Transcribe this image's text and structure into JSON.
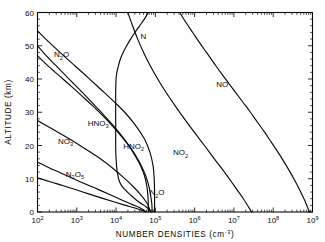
{
  "chart_data": {
    "type": "line",
    "title": "",
    "xlabel": "NUMBER DENSITIES (cm⁻³)",
    "ylabel": "ALTITUDE  (km)",
    "xscale": "log",
    "yscale": "linear",
    "xlim": [
      100,
      1000000000
    ],
    "ylim": [
      0,
      60
    ],
    "grid": false,
    "legend_position": "inline-curve-labels",
    "x_tick_labels": [
      "10²",
      "10³",
      "10⁴",
      "10⁵",
      "10⁶",
      "10⁷",
      "10⁸",
      "10⁹"
    ],
    "x_tick_exponents": [
      2,
      3,
      4,
      5,
      6,
      7,
      8,
      9
    ],
    "y_tick_labels": [
      "0",
      "10",
      "20",
      "30",
      "40",
      "50",
      "60"
    ],
    "y_tick_values": [
      0,
      10,
      20,
      30,
      40,
      50,
      60
    ],
    "axis_color": "#0a0a0a",
    "curve_color": "#0a0a0a",
    "series": [
      {
        "name": "NO",
        "label": "NO",
        "label_x_log": 6.55,
        "label_y_km": 37.5,
        "points_log_alt": [
          [
            5.62,
            60.0
          ],
          [
            5.78,
            57.0
          ],
          [
            5.95,
            54.0
          ],
          [
            6.12,
            51.0
          ],
          [
            6.3,
            48.0
          ],
          [
            6.48,
            45.0
          ],
          [
            6.66,
            42.0
          ],
          [
            6.85,
            39.0
          ],
          [
            7.04,
            36.0
          ],
          [
            7.23,
            33.0
          ],
          [
            7.42,
            30.0
          ],
          [
            7.6,
            27.0
          ],
          [
            7.78,
            24.0
          ],
          [
            7.95,
            21.0
          ],
          [
            8.12,
            18.0
          ],
          [
            8.28,
            15.0
          ],
          [
            8.43,
            12.0
          ],
          [
            8.57,
            9.0
          ],
          [
            8.7,
            6.0
          ],
          [
            8.82,
            3.0
          ],
          [
            8.92,
            0.0
          ]
        ]
      },
      {
        "name": "NO2",
        "label": "NO₂",
        "label_x_log": 5.45,
        "label_y_km": 17.0,
        "points_log_alt": [
          [
            4.3,
            60.0
          ],
          [
            4.42,
            56.0
          ],
          [
            4.55,
            52.0
          ],
          [
            4.7,
            48.0
          ],
          [
            4.87,
            44.0
          ],
          [
            5.06,
            40.0
          ],
          [
            5.27,
            36.0
          ],
          [
            5.5,
            32.0
          ],
          [
            5.74,
            28.0
          ],
          [
            5.99,
            24.0
          ],
          [
            6.25,
            20.0
          ],
          [
            6.5,
            16.0
          ],
          [
            6.76,
            12.0
          ],
          [
            7.0,
            8.0
          ],
          [
            7.24,
            4.0
          ],
          [
            7.45,
            0.0
          ]
        ]
      },
      {
        "name": "N",
        "label": "N",
        "label_x_log": 4.62,
        "label_y_km": 52.0,
        "points_log_alt": [
          [
            4.82,
            60.0
          ],
          [
            4.72,
            58.0
          ],
          [
            4.6,
            56.0
          ],
          [
            4.48,
            54.0
          ],
          [
            4.37,
            52.0
          ],
          [
            4.27,
            50.0
          ],
          [
            4.18,
            48.0
          ],
          [
            4.11,
            46.0
          ],
          [
            4.06,
            44.0
          ],
          [
            4.02,
            42.0
          ],
          [
            4.0,
            40.0
          ],
          [
            3.99,
            36.0
          ],
          [
            3.99,
            32.0
          ],
          [
            3.99,
            28.0
          ],
          [
            3.99,
            24.0
          ],
          [
            3.99,
            20.0
          ],
          [
            4.0,
            16.0
          ],
          [
            4.03,
            12.0
          ],
          [
            4.09,
            9.0
          ],
          [
            4.2,
            7.0
          ],
          [
            4.38,
            5.0
          ],
          [
            4.58,
            3.0
          ],
          [
            4.77,
            1.5
          ],
          [
            4.9,
            0.0
          ]
        ]
      },
      {
        "name": "N2O",
        "label": "N₂O",
        "label_x_log": 4.85,
        "label_y_km": 5.0,
        "secondary_label_x_log": 2.42,
        "secondary_label_y_km": 46.5,
        "points_log_alt": [
          [
            2.0,
            54.5
          ],
          [
            2.3,
            51.0
          ],
          [
            2.62,
            47.5
          ],
          [
            2.95,
            44.0
          ],
          [
            3.28,
            40.5
          ],
          [
            3.6,
            37.0
          ],
          [
            3.92,
            33.5
          ],
          [
            4.22,
            30.0
          ],
          [
            4.5,
            26.0
          ],
          [
            4.72,
            22.0
          ],
          [
            4.86,
            18.0
          ],
          [
            4.94,
            14.0
          ],
          [
            4.97,
            10.0
          ],
          [
            4.98,
            6.0
          ],
          [
            4.98,
            3.0
          ],
          [
            4.98,
            0.0
          ]
        ]
      },
      {
        "name": "HNO3",
        "label": "HNO₃",
        "label_x_log": 3.28,
        "label_y_km": 26.0,
        "points_log_alt": [
          [
            2.0,
            50.0
          ],
          [
            2.22,
            47.0
          ],
          [
            2.47,
            44.0
          ],
          [
            2.72,
            41.0
          ],
          [
            2.97,
            38.0
          ],
          [
            3.22,
            35.0
          ],
          [
            3.46,
            32.0
          ],
          [
            3.7,
            29.0
          ],
          [
            3.93,
            26.0
          ],
          [
            4.14,
            23.0
          ],
          [
            4.33,
            20.0
          ],
          [
            4.5,
            17.0
          ],
          [
            4.64,
            14.0
          ],
          [
            4.75,
            11.0
          ],
          [
            4.83,
            8.0
          ],
          [
            4.88,
            5.0
          ],
          [
            4.91,
            2.5
          ],
          [
            4.92,
            0.0
          ]
        ]
      },
      {
        "name": "HNO2",
        "label": "HNO₂",
        "label_x_log": 4.18,
        "label_y_km": 19.0,
        "points_log_alt": [
          [
            2.0,
            47.0
          ],
          [
            2.26,
            44.0
          ],
          [
            2.55,
            41.0
          ],
          [
            2.84,
            38.0
          ],
          [
            3.12,
            35.0
          ],
          [
            3.4,
            32.0
          ],
          [
            3.66,
            29.0
          ],
          [
            3.9,
            26.0
          ],
          [
            4.12,
            23.0
          ],
          [
            4.32,
            20.0
          ],
          [
            4.48,
            17.0
          ],
          [
            4.62,
            14.0
          ],
          [
            4.72,
            11.0
          ],
          [
            4.78,
            8.0
          ],
          [
            4.81,
            5.0
          ],
          [
            4.82,
            2.5
          ],
          [
            4.82,
            0.0
          ]
        ]
      },
      {
        "name": "NO3",
        "label": "NO₃",
        "label_x_log": 2.52,
        "label_y_km": 20.5,
        "points_log_alt": [
          [
            2.0,
            27.5
          ],
          [
            2.3,
            25.5
          ],
          [
            2.62,
            23.3
          ],
          [
            2.95,
            21.0
          ],
          [
            3.28,
            18.5
          ],
          [
            3.6,
            16.0
          ],
          [
            3.9,
            13.3
          ],
          [
            4.18,
            10.5
          ],
          [
            4.44,
            7.6
          ],
          [
            4.64,
            5.0
          ],
          [
            4.78,
            2.8
          ],
          [
            4.85,
            1.0
          ],
          [
            4.88,
            0.0
          ]
        ]
      },
      {
        "name": "N2O5",
        "label": "N₂O₅",
        "label_x_log": 2.72,
        "label_y_km": 10.5,
        "points_log_alt": [
          [
            2.0,
            15.0
          ],
          [
            2.28,
            13.4
          ],
          [
            2.58,
            11.8
          ],
          [
            2.9,
            10.1
          ],
          [
            3.22,
            8.4
          ],
          [
            3.54,
            6.8
          ],
          [
            3.85,
            5.2
          ],
          [
            4.13,
            3.7
          ],
          [
            4.38,
            2.4
          ],
          [
            4.58,
            1.4
          ],
          [
            4.7,
            0.6
          ],
          [
            4.76,
            0.0
          ]
        ]
      },
      {
        "name": "N2O5-lower",
        "label": "",
        "points_log_alt": [
          [
            2.0,
            10.3
          ],
          [
            2.32,
            9.1
          ],
          [
            2.66,
            7.9
          ],
          [
            3.0,
            6.6
          ],
          [
            3.34,
            5.3
          ],
          [
            3.66,
            4.1
          ],
          [
            3.96,
            3.0
          ],
          [
            4.24,
            2.0
          ],
          [
            4.48,
            1.2
          ],
          [
            4.66,
            0.5
          ],
          [
            4.76,
            0.0
          ]
        ]
      }
    ]
  },
  "figure": {
    "background_color": "#ffffff",
    "ink_color": "#0a0a0a"
  }
}
